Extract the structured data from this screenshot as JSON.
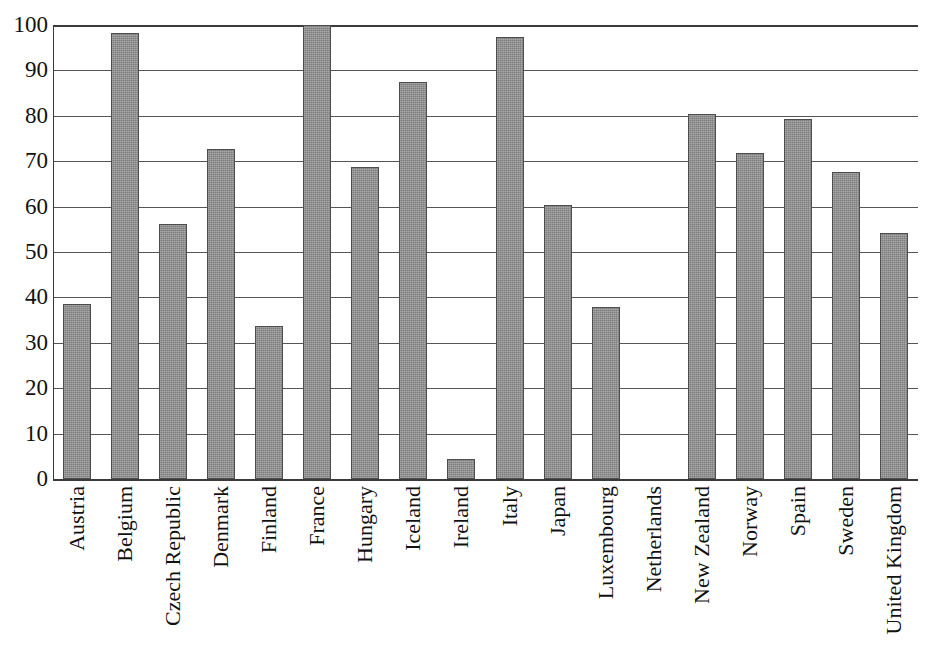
{
  "chart_data": {
    "type": "bar",
    "title": "",
    "subtitle": "",
    "xlabel": "",
    "ylabel": "",
    "ylim": [
      0,
      100
    ],
    "ytick_interval": 10,
    "grid": true,
    "legend": null,
    "legend_position": "none",
    "bar_color": "#8d8d8d",
    "bar_edge_color": "#4d4d4d",
    "axis_color": "#3a3a3a",
    "gridline_color": "#555555",
    "background_color": "#ffffff",
    "categories": [
      "Austria",
      "Belgium",
      "Czech Republic",
      "Denmark",
      "Finland",
      "France",
      "Hungary",
      "Iceland",
      "Ireland",
      "Italy",
      "Japan",
      "Luxembourg",
      "Netherlands",
      "New Zealand",
      "Norway",
      "Spain",
      "Sweden",
      "United Kingdom"
    ],
    "values": [
      38.5,
      98.2,
      56.2,
      72.6,
      33.7,
      100.0,
      68.7,
      87.4,
      4.4,
      97.4,
      60.4,
      37.8,
      0,
      80.4,
      71.8,
      79.4,
      67.7,
      54.1
    ],
    "yticks": [
      {
        "value": 100,
        "label": "100"
      },
      {
        "value": 90,
        "label": "90"
      },
      {
        "value": 80,
        "label": "80"
      },
      {
        "value": 70,
        "label": "70"
      },
      {
        "value": 60,
        "label": "60"
      },
      {
        "value": 50,
        "label": "50"
      },
      {
        "value": 40,
        "label": "40"
      },
      {
        "value": 30,
        "label": "30"
      },
      {
        "value": 20,
        "label": "20"
      },
      {
        "value": 10,
        "label": "10"
      },
      {
        "value": 0,
        "label": "0"
      }
    ]
  }
}
